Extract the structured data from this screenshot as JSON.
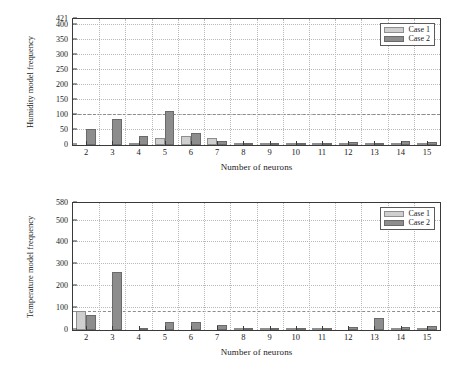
{
  "figure": {
    "background": "#ffffff",
    "colors": {
      "case1": "#cfcfcf",
      "case2": "#8d8d8d",
      "axis": "#3a3a3a",
      "grid": "#b9b9b9",
      "refline": "#8c8c8c"
    }
  },
  "chart_data": [
    {
      "id": "humidity",
      "type": "bar",
      "title": "",
      "xlabel": "Number of neurons",
      "ylabel": "Humidity model frequency",
      "categories": [
        "2",
        "3",
        "4",
        "5",
        "6",
        "7",
        "8",
        "9",
        "10",
        "11",
        "12",
        "13",
        "14",
        "15"
      ],
      "series": [
        {
          "name": "Case 1",
          "color": "#cfcfcf",
          "values": [
            0,
            0,
            2,
            24,
            31,
            22,
            2,
            1,
            5,
            1,
            2,
            2,
            6,
            1
          ]
        },
        {
          "name": "Case 2",
          "color": "#8d8d8d",
          "values": [
            55,
            86,
            31,
            113,
            41,
            15,
            4,
            2,
            4,
            4,
            10,
            8,
            14,
            9
          ]
        }
      ],
      "ylim": [
        0,
        421
      ],
      "yticks": [
        0,
        50,
        100,
        150,
        200,
        250,
        300,
        350,
        400,
        421
      ],
      "ytick_labels": [
        "0",
        "50",
        "100",
        "150",
        "200",
        "250",
        "300",
        "350",
        "400",
        "421"
      ],
      "reference_line": 100,
      "grid": true,
      "legend_position": "top-right",
      "legend_entries": [
        "Case 1",
        "Case 2"
      ]
    },
    {
      "id": "temperature",
      "type": "bar",
      "title": "",
      "xlabel": "Number of neurons",
      "ylabel": "Temperature model frequency",
      "categories": [
        "2",
        "3",
        "4",
        "5",
        "6",
        "7",
        "8",
        "9",
        "10",
        "11",
        "12",
        "13",
        "14",
        "15"
      ],
      "series": [
        {
          "name": "Case 1",
          "color": "#cfcfcf",
          "values": [
            88,
            0,
            0,
            0,
            0,
            0,
            2,
            5,
            2,
            2,
            0,
            0,
            2,
            1
          ]
        },
        {
          "name": "Case 2",
          "color": "#8d8d8d",
          "values": [
            70,
            265,
            11,
            38,
            37,
            22,
            3,
            1,
            5,
            1,
            16,
            56,
            13,
            17
          ]
        }
      ],
      "ylim": [
        0,
        580
      ],
      "yticks": [
        0,
        100,
        200,
        300,
        400,
        500,
        580
      ],
      "ytick_labels": [
        "0",
        "100",
        "200",
        "300",
        "400",
        "500",
        "580"
      ],
      "reference_line": 82,
      "grid": true,
      "legend_position": "top-right",
      "legend_entries": [
        "Case 1",
        "Case 2"
      ]
    }
  ]
}
